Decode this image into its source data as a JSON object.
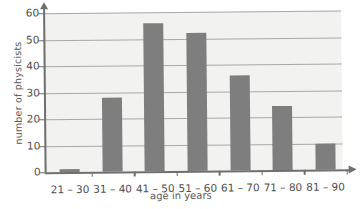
{
  "chart_data": {
    "type": "bar",
    "title": "",
    "xlabel": "age in years",
    "ylabel": "number of physicists",
    "categories": [
      "21 – 30",
      "31 – 40",
      "41 – 50",
      "51 – 60",
      "61 – 70",
      "71 – 80",
      "81 – 90"
    ],
    "values": [
      1,
      28,
      56,
      52,
      36,
      24,
      10
    ],
    "ylim": [
      0,
      60
    ],
    "yticks": [
      0,
      10,
      20,
      30,
      40,
      50,
      60
    ],
    "ytick_labels": [
      "0",
      "10",
      "20",
      "30",
      "40",
      "50",
      "60"
    ],
    "grid": true,
    "grid_axis": "y",
    "legend": false,
    "bar_color": "#7e7e7e",
    "plot_background": "#f2f2f0",
    "axis_color": "#6f6f6f"
  }
}
